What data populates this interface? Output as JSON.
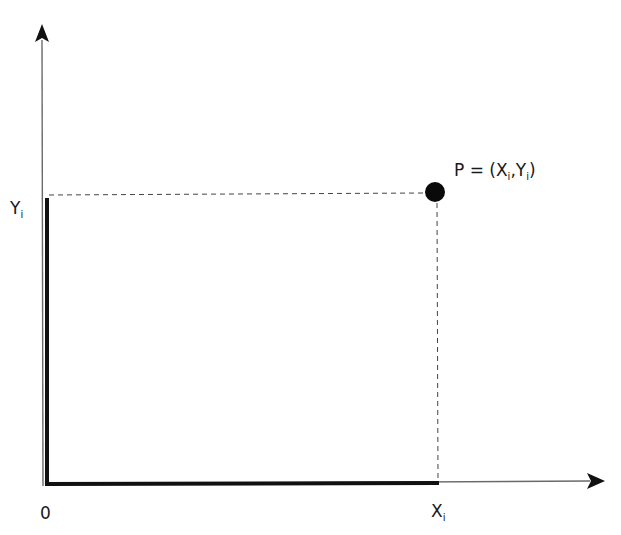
{
  "diagram": {
    "type": "cartesian-point-coordinates",
    "colors": {
      "axis": "#555555",
      "bold_segment": "#111111",
      "dashed": "#444444",
      "point": "#0a0a0a",
      "text": "#1a1a1a"
    },
    "origin_label": "0",
    "x_label": {
      "base": "X",
      "sub": "i"
    },
    "y_label": {
      "base": "Y",
      "sub": "i"
    },
    "point_label": {
      "prefix": "P = (",
      "x_base": "X",
      "x_sub": "i",
      "sep": ",",
      "y_base": "Y",
      "y_sub": "i",
      "suffix": ")"
    },
    "geometry": {
      "origin": [
        47,
        484
      ],
      "point": [
        435,
        192
      ],
      "x_axis_end": [
        604,
        482
      ],
      "y_axis_end": [
        42,
        24
      ]
    }
  }
}
